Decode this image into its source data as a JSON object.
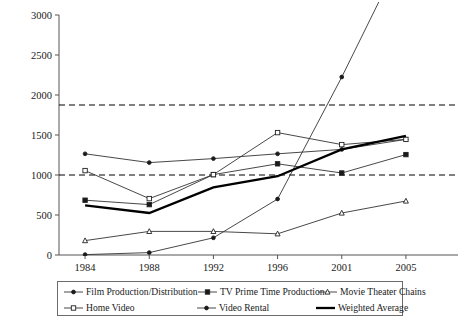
{
  "chart_data": {
    "type": "line",
    "title": "",
    "subtitle": "",
    "xlabel": "",
    "ylabel": "",
    "categories": [
      "1984",
      "1988",
      "1992",
      "1996",
      "2001",
      "2005"
    ],
    "x_tick_labels": [
      "1984",
      "1988",
      "1992",
      "1996",
      "2001",
      "2005"
    ],
    "y_tick_labels": [
      "0",
      "500",
      "1000",
      "1500",
      "2000",
      "2500",
      "3000"
    ],
    "y_ticks": [
      0,
      500,
      1000,
      1500,
      2000,
      2500,
      3000
    ],
    "ylim": [
      0,
      3000
    ],
    "grid": false,
    "legend_position": "bottom",
    "reference_lines": [
      {
        "name": "upper-reference-line",
        "value": 1875,
        "style": "dashed"
      },
      {
        "name": "lower-reference-line",
        "value": 1000,
        "style": "dashed"
      }
    ],
    "series": [
      {
        "name": "Film Production/Distribution",
        "marker": "filled-diamond",
        "line_width": "thin",
        "values": [
          1265,
          1155,
          1205,
          1265,
          1320,
          1445
        ]
      },
      {
        "name": "TV Prime Time Production",
        "marker": "filled-square",
        "line_width": "thin",
        "values": [
          685,
          630,
          1005,
          1140,
          1025,
          1255
        ]
      },
      {
        "name": "Movie Theater Chains",
        "marker": "open-triangle",
        "line_width": "thin",
        "values": [
          180,
          295,
          295,
          265,
          525,
          675
        ]
      },
      {
        "name": "Home Video",
        "marker": "open-square",
        "line_width": "thin",
        "values": [
          1055,
          705,
          1005,
          1530,
          1380,
          1445
        ]
      },
      {
        "name": "Video Rental",
        "marker": "filled-circle",
        "line_width": "thin",
        "values": [
          5,
          30,
          215,
          700,
          2225,
          3850
        ]
      },
      {
        "name": "Weighted Average",
        "marker": "none",
        "line_width": "thick",
        "values": [
          620,
          525,
          845,
          985,
          1320,
          1490
        ]
      }
    ]
  },
  "legend": {
    "items": [
      {
        "label": "Film Production/Distribution",
        "marker": "filled-diamond",
        "column": 1,
        "row": 1
      },
      {
        "label": "TV Prime Time Production",
        "marker": "filled-square",
        "column": 2,
        "row": 1
      },
      {
        "label": "Movie Theater Chains",
        "marker": "open-triangle",
        "column": 3,
        "row": 1
      },
      {
        "label": "Home Video",
        "marker": "open-square",
        "column": 1,
        "row": 2
      },
      {
        "label": "Video Rental",
        "marker": "filled-circle",
        "column": 2,
        "row": 2
      },
      {
        "label": "Weighted Average",
        "marker": "none",
        "column": 3,
        "row": 2
      }
    ]
  },
  "colors": {
    "line": "#333333",
    "thick_line": "#000000",
    "axis": "#555555",
    "reference_line": "#000000",
    "background": "#ffffff",
    "text": "#1a1a1a"
  }
}
